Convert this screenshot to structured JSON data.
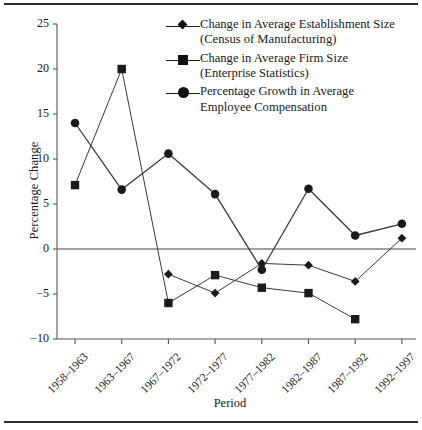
{
  "chart_data": {
    "type": "line",
    "title": "",
    "xlabel": "Period",
    "ylabel": "Percentage Change",
    "ylim": [
      -10,
      25
    ],
    "yticks": [
      -10,
      -5,
      0,
      5,
      10,
      15,
      20,
      25
    ],
    "ytick_labels": [
      "−10",
      "−5",
      "0",
      "5",
      "10",
      "15",
      "20",
      "25"
    ],
    "grid": false,
    "zero_line": true,
    "legend_position": "top-right",
    "categories": [
      "1958–1963",
      "1963–1967",
      "1967–1972",
      "1972–1977",
      "1977–1982",
      "1982–1987",
      "1987–1992",
      "1992–1997"
    ],
    "series": [
      {
        "name": "Change in Average Establishment Size (Census of Manufacturing)",
        "name_line1": "Change in Average Establishment Size",
        "name_line2": "(Census of Manufacturing)",
        "marker": "diamond",
        "values": [
          null,
          null,
          -2.8,
          -4.9,
          -1.6,
          -1.8,
          -3.6,
          1.2
        ]
      },
      {
        "name": "Change in  Average Firm  Size (Enterprise Statistics)",
        "name_line1": "Change in  Average Firm  Size",
        "name_line2": "(Enterprise Statistics)",
        "marker": "square",
        "values": [
          7.1,
          20.0,
          -6.0,
          -2.9,
          -4.3,
          -4.9,
          -7.8,
          null
        ]
      },
      {
        "name": "Percentage Growth in Average Employee Compensation",
        "name_line1": "Percentage Growth in Average",
        "name_line2": "Employee Compensation",
        "marker": "circle",
        "values": [
          14.0,
          6.6,
          10.6,
          6.1,
          -2.3,
          6.7,
          1.5,
          2.8
        ]
      }
    ]
  },
  "colors": {
    "ink": "#1a1a1a",
    "line": "#3a3a3a",
    "axis": "#555555",
    "zero": "#808080",
    "rule": "#2b2b2b",
    "background": "#ffffff"
  }
}
